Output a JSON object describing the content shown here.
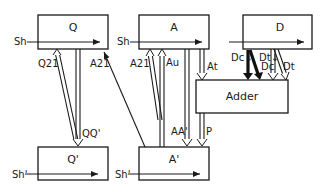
{
  "diagram": {
    "boxes": {
      "q": "Q",
      "a": "A",
      "d": "D",
      "adder": "Adder",
      "q_prime": "Q'",
      "a_prime": "A'"
    },
    "inputs": {
      "sh_q": "Sh",
      "sh_a": "Sh",
      "sh_q_prime": "Sh'",
      "sh_a_prime": "Sh'"
    },
    "arrow_labels": {
      "q21": "Q21",
      "qq_prime": "QQ'",
      "a21_left": "A21",
      "a21_right": "A21",
      "au": "Au",
      "at": "At",
      "aa_prime": "AA'",
      "p": "P",
      "dc_down": "Dc↓",
      "dc": "Dc",
      "dt_down": "Dt↓",
      "dt": "Dt"
    }
  }
}
